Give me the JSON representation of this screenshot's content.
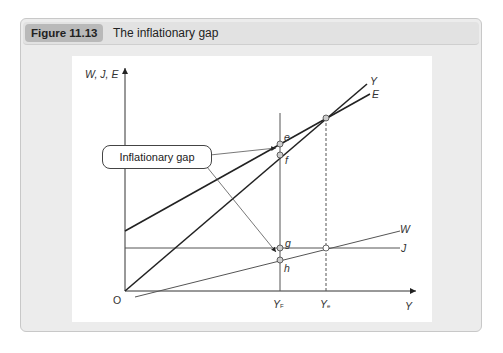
{
  "figure": {
    "number": "Figure 11.13",
    "title": "The inflationary gap"
  },
  "axes": {
    "y_label": "W, J, E",
    "x_label": "Y",
    "origin_label": "O"
  },
  "lines": {
    "y": "Y",
    "e": "E",
    "w": "W",
    "j": "J"
  },
  "points": {
    "e": "e",
    "f": "f",
    "g": "g",
    "h": "h"
  },
  "ticks": {
    "yf_main": "Y",
    "yf_sub": "F",
    "ye_main": "Y",
    "ye_sub": "e"
  },
  "callout": {
    "label": "Inflationary gap"
  },
  "colors": {
    "frame_bg": "#ececec",
    "badge_bg": "#b9b9b9",
    "line": "#333333",
    "point_fill": "#cccccc"
  }
}
